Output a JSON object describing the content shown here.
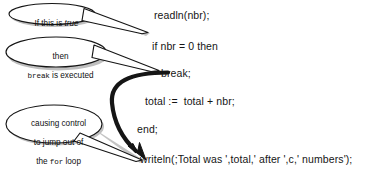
{
  "figure": {
    "background_color": "#ffffff",
    "ink_color": "#151515",
    "shadow_color": "#b8b8b8"
  },
  "code": {
    "lines": [
      {
        "id": "readln",
        "text": "readln(nbr);"
      },
      {
        "id": "if",
        "text": "if nbr = 0 then"
      },
      {
        "id": "break",
        "text": "break;"
      },
      {
        "id": "total",
        "text": "total :=  total + nbr;"
      },
      {
        "id": "end",
        "text": "end;"
      },
      {
        "id": "writeln",
        "text": "writeln(;Total was ',total,' after ',c,' numbers');"
      }
    ]
  },
  "callouts": [
    {
      "id": "callout-if-true",
      "lines": [
        {
          "parts": [
            {
              "text": "If this is ",
              "style": "normal"
            },
            {
              "text": "true",
              "style": "italic"
            }
          ]
        }
      ],
      "points_to": "readln"
    },
    {
      "id": "callout-break-executed",
      "lines": [
        {
          "parts": [
            {
              "text": "then",
              "style": "normal"
            }
          ]
        },
        {
          "parts": [
            {
              "text": "break",
              "style": "mono"
            },
            {
              "text": " is executed",
              "style": "normal"
            }
          ]
        }
      ],
      "points_to": "break"
    },
    {
      "id": "callout-jump-out",
      "lines": [
        {
          "parts": [
            {
              "text": "causing control",
              "style": "normal"
            }
          ]
        },
        {
          "parts": [
            {
              "text": "to jump out of",
              "style": "normal"
            }
          ]
        },
        {
          "parts": [
            {
              "text": "the ",
              "style": "normal"
            },
            {
              "text": "for",
              "style": "mono"
            },
            {
              "text": " loop",
              "style": "normal"
            }
          ]
        }
      ],
      "points_to": "writeln"
    }
  ],
  "arrows": [
    {
      "id": "arrow-break-to-writeln",
      "kind": "curved-thick",
      "from": "break",
      "to": "writeln"
    }
  ]
}
